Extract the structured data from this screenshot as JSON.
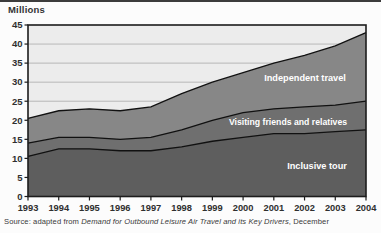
{
  "header": {
    "units_label": "Millions"
  },
  "source_line": {
    "prefix": "Source: adapted from ",
    "title_italic": "Demand for Outbound Leisure Air Travel and its Key Drivers",
    "suffix": ", December"
  },
  "colors": {
    "page_background": "#fcfcfc",
    "plot_background": "#ececec",
    "gridline": "#a9a9a9",
    "axis_and_border": "#1c1c1c",
    "boundary_line": "#111111",
    "band_label_text": "#ffffff",
    "tick_label_text": "#2f2f2f",
    "inclusive_tour_fill": "#5e5e5e",
    "vfr_fill": "#6f6f6f",
    "independent_travel_fill": "#878787"
  },
  "chart_data": {
    "type": "area",
    "stacked": true,
    "title": "",
    "ylabel": "Millions",
    "xlabel": "",
    "ylim": [
      0,
      45
    ],
    "yticks": [
      0,
      5,
      10,
      15,
      20,
      25,
      30,
      35,
      40,
      45
    ],
    "grid": "horizontal",
    "legend_position": "labels-inside-areas",
    "x": [
      1993,
      1994,
      1995,
      1996,
      1997,
      1998,
      1999,
      2000,
      2001,
      2002,
      2003,
      2004
    ],
    "series": [
      {
        "name": "Inclusive tour",
        "color_key": "inclusive_tour_fill",
        "values": [
          10.5,
          12.5,
          12.5,
          12,
          12,
          13,
          14.5,
          15.5,
          16.5,
          16.5,
          17,
          17.5
        ]
      },
      {
        "name": "Visiting friends and relatives",
        "color_key": "vfr_fill",
        "values": [
          3.5,
          3,
          3,
          3,
          3.5,
          4.5,
          5.5,
          6.5,
          6.5,
          7,
          7,
          7.5
        ]
      },
      {
        "name": "Independent travel",
        "color_key": "independent_travel_fill",
        "values": [
          6.5,
          7,
          7.5,
          7.5,
          8,
          9.5,
          10,
          10.5,
          12,
          13.5,
          15.5,
          18
        ]
      }
    ],
    "cumulative_totals": {
      "inclusive_tour_top": [
        10.5,
        12.5,
        12.5,
        12,
        12,
        13,
        14.5,
        15.5,
        16.5,
        16.5,
        17,
        17.5
      ],
      "vfr_top": [
        14,
        15.5,
        15.5,
        15,
        15.5,
        17.5,
        20,
        22,
        23,
        23.5,
        24,
        25
      ],
      "overall_total": [
        20.5,
        22.5,
        23,
        22.5,
        23.5,
        27,
        30,
        32.5,
        35,
        37,
        39.5,
        43
      ]
    }
  }
}
